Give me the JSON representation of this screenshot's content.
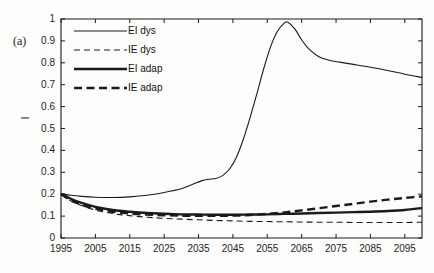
{
  "figure": {
    "panel_label": "(a)",
    "background": "#fdfdfc",
    "line_color": "#1a1a1a"
  },
  "chart_data": {
    "type": "line",
    "title": "",
    "xlabel": "",
    "ylabel": "I",
    "xlim": [
      1995,
      2100
    ],
    "ylim": [
      0,
      1
    ],
    "grid": false,
    "legend_position": "top-left-inside",
    "xticks": [
      1995,
      2005,
      2015,
      2025,
      2035,
      2045,
      2055,
      2065,
      2075,
      2085,
      2095
    ],
    "xtick_labels": [
      "1995",
      "2005",
      "2015",
      "2025",
      "2035",
      "2045",
      "2055",
      "2065",
      "2075",
      "2085",
      "2095"
    ],
    "yticks": [
      0,
      0.1,
      0.2,
      0.3,
      0.4,
      0.5,
      0.6,
      0.7,
      0.8,
      0.9,
      1
    ],
    "ytick_labels": [
      "0",
      "0.1",
      "0.2",
      "0.3",
      "0.4",
      "0.5",
      "0.6",
      "0.7",
      "0.8",
      "0.9",
      "1"
    ],
    "series": [
      {
        "name": "EI dys",
        "style": "solid",
        "width": 1.1,
        "color": "#1a1a1a",
        "x": [
          1995,
          1998,
          2001,
          2005,
          2010,
          2015,
          2020,
          2025,
          2030,
          2033,
          2036,
          2038,
          2040,
          2042,
          2044,
          2046,
          2048,
          2050,
          2052,
          2054,
          2056,
          2058,
          2060,
          2061,
          2063,
          2065,
          2067,
          2070,
          2073,
          2076,
          2080,
          2085,
          2090,
          2095,
          2100
        ],
        "y": [
          0.203,
          0.195,
          0.19,
          0.186,
          0.185,
          0.188,
          0.195,
          0.208,
          0.225,
          0.243,
          0.262,
          0.268,
          0.272,
          0.285,
          0.315,
          0.368,
          0.45,
          0.55,
          0.66,
          0.775,
          0.875,
          0.945,
          0.982,
          0.985,
          0.955,
          0.905,
          0.865,
          0.828,
          0.812,
          0.803,
          0.793,
          0.78,
          0.765,
          0.748,
          0.733
        ]
      },
      {
        "name": "IE dys",
        "style": "dashed",
        "width": 1.1,
        "color": "#1a1a1a",
        "x": [
          1995,
          1998,
          2001,
          2005,
          2010,
          2015,
          2020,
          2025,
          2030,
          2035,
          2040,
          2045,
          2050,
          2055,
          2060,
          2065,
          2070,
          2075,
          2080,
          2085,
          2090,
          2095,
          2100
        ],
        "y": [
          0.2,
          0.168,
          0.148,
          0.128,
          0.112,
          0.102,
          0.095,
          0.09,
          0.086,
          0.083,
          0.08,
          0.078,
          0.076,
          0.075,
          0.074,
          0.073,
          0.072,
          0.072,
          0.071,
          0.071,
          0.071,
          0.071,
          0.072
        ]
      },
      {
        "name": "EI adap",
        "style": "solid",
        "width": 2.4,
        "color": "#1a1a1a",
        "x": [
          1995,
          1998,
          2001,
          2005,
          2010,
          2015,
          2020,
          2025,
          2030,
          2035,
          2040,
          2045,
          2050,
          2055,
          2060,
          2065,
          2070,
          2075,
          2080,
          2085,
          2090,
          2095,
          2100
        ],
        "y": [
          0.202,
          0.178,
          0.16,
          0.142,
          0.128,
          0.12,
          0.114,
          0.111,
          0.108,
          0.107,
          0.106,
          0.106,
          0.107,
          0.108,
          0.11,
          0.112,
          0.114,
          0.116,
          0.118,
          0.12,
          0.123,
          0.128,
          0.137
        ]
      },
      {
        "name": "IE adap",
        "style": "dashed",
        "width": 2.4,
        "color": "#1a1a1a",
        "x": [
          1995,
          1998,
          2001,
          2005,
          2010,
          2015,
          2020,
          2025,
          2030,
          2035,
          2040,
          2045,
          2050,
          2055,
          2060,
          2065,
          2070,
          2075,
          2080,
          2085,
          2090,
          2095,
          2100
        ],
        "y": [
          0.2,
          0.172,
          0.152,
          0.134,
          0.12,
          0.112,
          0.107,
          0.104,
          0.102,
          0.101,
          0.101,
          0.102,
          0.105,
          0.11,
          0.117,
          0.126,
          0.136,
          0.146,
          0.156,
          0.166,
          0.175,
          0.183,
          0.19
        ]
      }
    ]
  },
  "legend": {
    "items": [
      {
        "label": "EI dys",
        "style": "solid",
        "width": 1.1
      },
      {
        "label": "IE dys",
        "style": "dashed",
        "width": 1.1
      },
      {
        "label": "EI adap",
        "style": "solid",
        "width": 2.4
      },
      {
        "label": "IE adap",
        "style": "dashed",
        "width": 2.4
      }
    ]
  }
}
